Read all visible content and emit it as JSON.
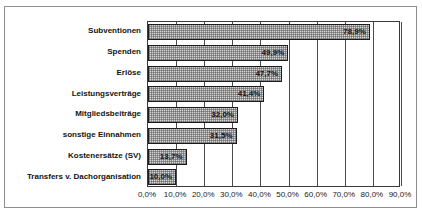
{
  "figure": {
    "top_caption_sliver": "",
    "frame": true
  },
  "chart_data": {
    "type": "bar",
    "orientation": "horizontal",
    "title": "",
    "xlabel": "",
    "ylabel": "",
    "grid": true,
    "legend": false,
    "xlim": [
      0,
      90
    ],
    "categories": [
      "Subventionen",
      "Spenden",
      "Erlöse",
      "Leistungsverträge",
      "Mitgliedsbeiträge",
      "sonstige Einnahmen",
      "Kostenersätze (SV)",
      "Transfers v. Dachorganisation"
    ],
    "values": [
      78.9,
      49.9,
      47.7,
      41.4,
      32.0,
      31.5,
      13.7,
      10.0
    ],
    "value_labels": [
      "78,9%",
      "49,9%",
      "47,7%",
      "41,4%",
      "32,0%",
      "31,5%",
      "13,7%",
      "10,0%"
    ],
    "xticks": [
      0,
      10,
      20,
      30,
      40,
      50,
      60,
      70,
      80,
      90
    ],
    "xtick_labels": [
      "0,0%",
      "10,0%",
      "20,0%",
      "30,0%",
      "40,0%",
      "50,0%",
      "60,0%",
      "70,0%",
      "80,0%",
      "90,0%"
    ],
    "colors": {
      "bar_fill": "#d6d6d6",
      "bar_pattern": "#5a5a5a",
      "bar_border": "#1c1c1c",
      "gridline": "#4a4a4a",
      "axis": "#3a3a3a",
      "text": "#141414",
      "frame": "#8d8d8d",
      "background": "#ffffff"
    }
  }
}
